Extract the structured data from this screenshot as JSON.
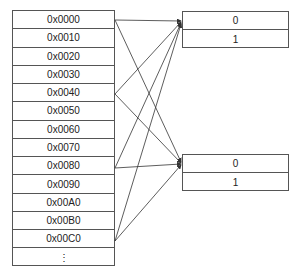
{
  "address_table": {
    "rows": [
      "0x0000",
      "0x0010",
      "0x0020",
      "0x0030",
      "0x0040",
      "0x0050",
      "0x0060",
      "0x0070",
      "0x0080",
      "0x0090",
      "0x00A0",
      "0x00B0",
      "0x00C0",
      "⋮"
    ]
  },
  "target_tables": [
    {
      "id": "set-a",
      "rows": [
        "0",
        "1"
      ]
    },
    {
      "id": "set-b",
      "rows": [
        "0",
        "1"
      ]
    }
  ],
  "connections": [
    {
      "from": "0x0000",
      "to": "set-a"
    },
    {
      "from": "0x0000",
      "to": "set-b"
    },
    {
      "from": "0x0040",
      "to": "set-a"
    },
    {
      "from": "0x0040",
      "to": "set-b"
    },
    {
      "from": "0x0080",
      "to": "set-a"
    },
    {
      "from": "0x0080",
      "to": "set-b"
    },
    {
      "from": "0x00C0",
      "to": "set-a"
    },
    {
      "from": "0x00C0",
      "to": "set-b"
    }
  ],
  "colors": {
    "line": "#333333",
    "border": "#555555",
    "text": "#222222"
  }
}
